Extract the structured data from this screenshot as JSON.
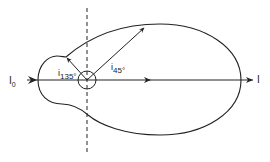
{
  "diagram": {
    "type": "polar scattering / intensity diagram",
    "colors": {
      "line": "#222222",
      "background": "#ffffff"
    },
    "labels": {
      "incident": {
        "main": "I",
        "sub": "0"
      },
      "transmitted": "I",
      "angle_135": {
        "main": "i",
        "sub": "135°"
      },
      "angle_45": {
        "main": "i",
        "sub": "45°"
      }
    },
    "elements": [
      "horizontal axis with arrows",
      "dashed vertical line through scatterer",
      "small circle (scatterer) at origin",
      "closed lobe curve (large forward lobe, small backward lobe)",
      "vector arrow at 45°",
      "vector arrow at 135°"
    ]
  }
}
